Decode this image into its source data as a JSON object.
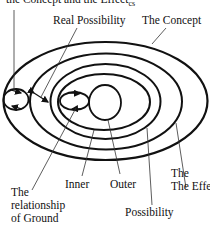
{
  "diagram": {
    "title_partial": "the Concept and the Effect",
    "title_sub": "cs",
    "labels": {
      "real_possibility": "Real Possibility",
      "the_concept": "The Concept",
      "the_effect": "The Effect",
      "the_effect_sub": "cs",
      "the_effect_line1": "The",
      "relationship_line1": "The",
      "relationship_line2": "relationship",
      "relationship_line3": "of Ground",
      "inner": "Inner",
      "outer": "Outer",
      "possibility": "Possibility"
    },
    "ellipses": [
      {
        "name": "the-concept",
        "cx": 105.5,
        "cy": 101,
        "rx": 102,
        "ry": 59
      },
      {
        "name": "the-effect",
        "cx": 106,
        "cy": 101.5,
        "rx": 76,
        "ry": 48
      },
      {
        "name": "possibility",
        "cx": 105.5,
        "cy": 101.5,
        "rx": 55,
        "ry": 37.5
      },
      {
        "name": "real-possibility",
        "cx": 104,
        "cy": 102,
        "rx": 46,
        "ry": 28
      }
    ],
    "stroke_color": "#111111"
  }
}
